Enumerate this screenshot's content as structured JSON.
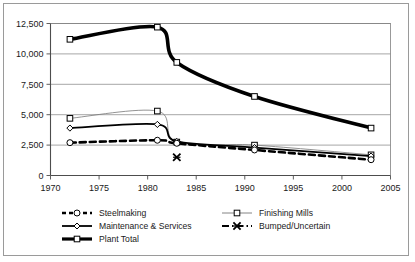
{
  "chart_data": {
    "type": "line",
    "title": "",
    "xlabel": "",
    "ylabel": "",
    "xlim": [
      1970,
      2005
    ],
    "ylim": [
      0,
      12500
    ],
    "grid": true,
    "legend_position": "bottom",
    "xticks": [
      "1970",
      "1975",
      "1980",
      "1985",
      "1990",
      "1995",
      "2000",
      "2005"
    ],
    "xtick_values": [
      1970,
      1975,
      1980,
      1985,
      1990,
      1995,
      2000,
      2005
    ],
    "yticks": [
      "0",
      "2,500",
      "5,000",
      "7,500",
      "10,000",
      "12,500"
    ],
    "ytick_values": [
      0,
      2500,
      5000,
      7500,
      10000,
      12500
    ],
    "series": [
      {
        "name": "Steelmaking",
        "marker": "circle",
        "style": "dashed",
        "width": 2.6,
        "color": "#000000",
        "x": [
          1972,
          1981,
          1983,
          1991,
          2003
        ],
        "values": [
          2700,
          2900,
          2650,
          2100,
          1300
        ]
      },
      {
        "name": "Finishing Mills",
        "marker": "square",
        "style": "thin",
        "width": 0.8,
        "color": "#777777",
        "x": [
          1972,
          1981,
          1983,
          1991,
          2003
        ],
        "values": [
          4700,
          5300,
          2750,
          2500,
          1700
        ]
      },
      {
        "name": "Maintenance & Services",
        "marker": "diamond",
        "style": "solid",
        "width": 1.8,
        "color": "#000000",
        "x": [
          1972,
          1981,
          1983,
          1991,
          2003
        ],
        "values": [
          3900,
          4200,
          2800,
          2300,
          1600
        ]
      },
      {
        "name": "Bumped/Uncertain",
        "marker": "x",
        "style": "marker-only",
        "width": 1.6,
        "color": "#000000",
        "x": [
          1983
        ],
        "values": [
          1500
        ]
      },
      {
        "name": "Plant Total",
        "marker": "square",
        "style": "thick",
        "width": 3.6,
        "color": "#000000",
        "x": [
          1972,
          1981,
          1983,
          1991,
          2003
        ],
        "values": [
          11200,
          12200,
          9300,
          6500,
          3900
        ]
      }
    ]
  },
  "legend": {
    "items": [
      {
        "label": "Steelmaking",
        "key": "steelmaking"
      },
      {
        "label": "Finishing Mills",
        "key": "finishing-mills"
      },
      {
        "label": "Maintenance & Services",
        "key": "maintenance-services"
      },
      {
        "label": "Bumped/Uncertain",
        "key": "bumped-uncertain"
      },
      {
        "label": "Plant Total",
        "key": "plant-total"
      }
    ]
  }
}
